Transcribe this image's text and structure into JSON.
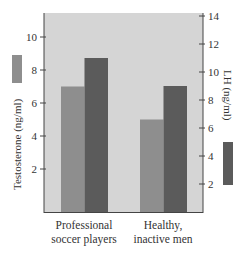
{
  "chart_data": {
    "type": "bar",
    "title": "",
    "categories": [
      "Professional soccer players",
      "Healthy, inactive men"
    ],
    "category_lines": [
      [
        "Professional",
        "soccer players"
      ],
      [
        "Healthy,",
        "inactive men"
      ]
    ],
    "series": [
      {
        "name": "Testosterone (ng/ml)",
        "axis": "left",
        "color": "#8e8e8e",
        "values": [
          7,
          5
        ]
      },
      {
        "name": "LH (ng/ml)",
        "axis": "right",
        "color": "#5b5b5b",
        "values": [
          11,
          9
        ]
      }
    ],
    "left_axis": {
      "label": "Testosterone (ng/ml)",
      "ticks": [
        2,
        4,
        6,
        8,
        10
      ],
      "ylim": [
        0,
        11.5
      ]
    },
    "right_axis": {
      "label": "LH (ng/ml)",
      "ticks": [
        2,
        4,
        6,
        8,
        10,
        12,
        14
      ],
      "ylim": [
        0,
        14
      ]
    },
    "xlabel": "",
    "grid": false,
    "legend": "color swatches beside axis labels",
    "plot_background": "#d5d5d5"
  }
}
